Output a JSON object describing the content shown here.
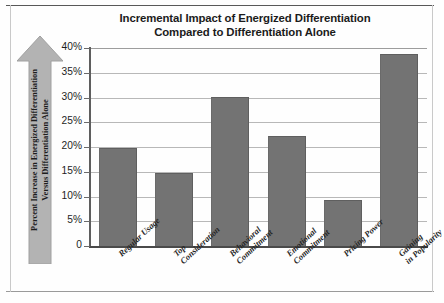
{
  "chart_data": {
    "type": "bar",
    "title": "Incremental Impact of Energized Differentiation Compared to Differentiation Alone",
    "title_lines": [
      "Incremental Impact of Energized Differentiation",
      "Compared to Differentiation Alone"
    ],
    "xlabel": "",
    "ylabel": "Percent Increase in Energized Differentiation Versus Differentiation Alone",
    "ylabel_lines": [
      "Percent Increase in Energized Differentiation",
      "Versus Differentiation Alone"
    ],
    "categories": [
      "Regular Usage",
      "Top Consideration",
      "Behavioral Commitment",
      "Emotional Commitment",
      "Pricing Power",
      "Gaining in Popularity"
    ],
    "category_lines": [
      [
        "Regular Usage"
      ],
      [
        "Top",
        "Consideration"
      ],
      [
        "Behavioral",
        "Commitment"
      ],
      [
        "Emotional",
        "Commitment"
      ],
      [
        "Pricing Power"
      ],
      [
        "Gaining",
        "in Popularity"
      ]
    ],
    "values": [
      19.7,
      14.7,
      30.2,
      22.3,
      9.2,
      38.8
    ],
    "ylim": [
      0,
      40
    ],
    "ytick_values": [
      0,
      5,
      10,
      15,
      20,
      25,
      30,
      35,
      40
    ],
    "ytick_labels": [
      "0",
      "5%",
      "10%",
      "15%",
      "20%",
      "25%",
      "30%",
      "35%",
      "40%"
    ],
    "grid": true,
    "legend": false,
    "bar_color": "#737373",
    "gridline_color": "#b8b8b8",
    "axis_color": "#4a4a4a",
    "text_color": "#1d1d1d",
    "ylabel_arrow_color": "#b3b3b3"
  }
}
